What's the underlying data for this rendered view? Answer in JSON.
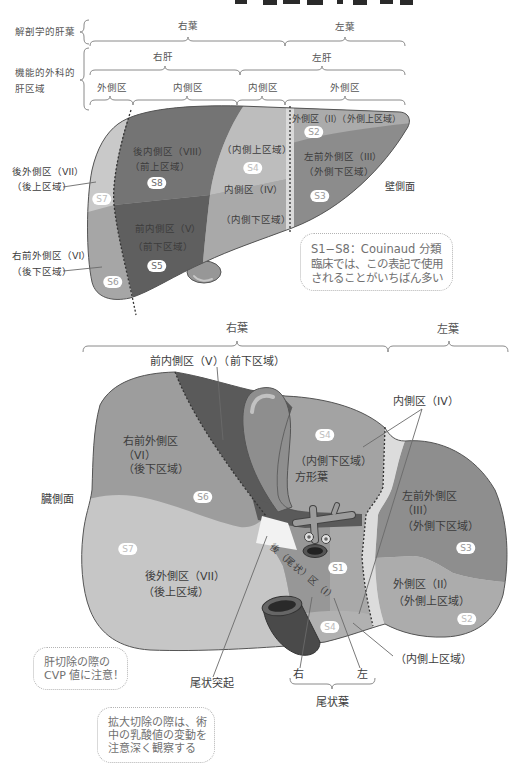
{
  "colors": {
    "top": {
      "s7": "#c9c9c9",
      "s6": "#a6a6a6",
      "s8": "#747474",
      "s5": "#5f5f5f",
      "s4_upper": "#bdbdbd",
      "s4_lower": "#a9a9a9",
      "s2": "#ababab",
      "s3": "#8c8c8c",
      "falciform": "#dadada",
      "gallbladder": "#979797"
    },
    "bottom": {
      "s7": "#c6c6c6",
      "s6": "#9d9d9d",
      "s5": "#5a5a5a",
      "s4": "#a3a3a3",
      "s4_lower": "#b1b1b1",
      "s1": "#a9a9a9",
      "caudate": "#979797",
      "caudate_process": "#f2f2f2",
      "s3": "#8e8e8e",
      "s2": "#acacac",
      "falciform": "#dcdcdc",
      "gallbladder": "#8e8e8e"
    }
  },
  "top_diagram": {
    "header": {
      "anatomical_label": "解剖学的肝葉",
      "functional_label": [
        "機能的外科的",
        "肝区域"
      ],
      "lobes": [
        {
          "label": "右葉"
        },
        {
          "label": "左葉"
        }
      ],
      "livers": [
        {
          "label": "右肝"
        },
        {
          "label": "左肝"
        }
      ],
      "sections": [
        {
          "label": "外側区"
        },
        {
          "label": "内側区"
        },
        {
          "label": "内側区"
        },
        {
          "label": "外側区"
        }
      ]
    },
    "segment_labels": {
      "s8": [
        "後内側区（VIII）",
        "（前上区域）"
      ],
      "s4_upper": "（内側上区域）",
      "s4_name": "内側区（IV）",
      "s4_lower": "（内側下区域）",
      "s5": [
        "前内側区（V）",
        "（前下区域）"
      ],
      "s2": "外側区（II）（外側上区域）",
      "s3": [
        "左前外側区（III）",
        "（外側下区域）"
      ]
    },
    "side_labels": {
      "s7": [
        "後外側区（VII）",
        "（後上区域）"
      ],
      "s6": [
        "右前外側区（VI）",
        "（後下区域）"
      ]
    },
    "badges": {
      "s8": "S8",
      "s4": "S4",
      "s5": "S5",
      "s7": "S7",
      "s6": "S6",
      "s2": "S2",
      "s3": "S3"
    },
    "surface_label": "壁側面",
    "note": [
      "S1−S8：Couinaud 分類",
      "臨床では、この表記で使用",
      "されることがいちばん多い"
    ]
  },
  "bottom_diagram": {
    "lobes": [
      {
        "label": "右葉"
      },
      {
        "label": "左葉"
      }
    ],
    "callouts": {
      "s5": "前内側区（V）（前下区域）",
      "s4": "内側区（IV）",
      "s4_upper": "（内側上区域）",
      "caudate_process": "尾状突起"
    },
    "segment_labels": {
      "s6": [
        "右前外側区",
        "（VI）",
        "（後下区域）"
      ],
      "s4": [
        "（内側下区域）",
        "方形葉"
      ],
      "s3": [
        "左前外側区",
        "（III）",
        "（外側下区域）"
      ],
      "s2": [
        "外側区（II）",
        "（外側上区域）"
      ],
      "s7": [
        "後外側区（VII）",
        "（後上区域）"
      ],
      "s1": "後（尾状）区（I）"
    },
    "badges": {
      "s4": "S4",
      "s6": "S6",
      "s7": "S7",
      "s3": "S3",
      "s1": "S1",
      "s2": "S2",
      "s4_lower": "S4"
    },
    "surface_label": "臓側面",
    "caudate_lobe": {
      "right": "右",
      "left": "左",
      "label": "尾状葉"
    },
    "notes": [
      [
        "肝切除の際の",
        "CVP 値に注意！"
      ],
      [
        "拡大切除の際は、術",
        "中の乳酸値の変動を",
        "注意深く観察する"
      ]
    ]
  }
}
